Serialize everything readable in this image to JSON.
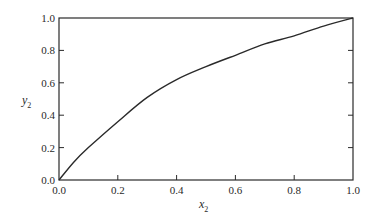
{
  "chart_data": {
    "type": "line",
    "title": "",
    "xlabel": "x2",
    "ylabel": "y2",
    "xlabel_main": "x",
    "xlabel_sub": "2",
    "ylabel_main": "y",
    "ylabel_sub": "2",
    "xlim": [
      0.0,
      1.0
    ],
    "ylim": [
      0.0,
      1.0
    ],
    "grid": false,
    "legend": null,
    "x_ticks": [
      "0.0",
      "0.2",
      "0.4",
      "0.6",
      "0.8",
      "1.0"
    ],
    "y_ticks": [
      "0.0",
      "0.2",
      "0.4",
      "0.6",
      "0.8",
      "1.0"
    ],
    "x": [
      0.0,
      0.05,
      0.1,
      0.2,
      0.3,
      0.4,
      0.5,
      0.6,
      0.7,
      0.8,
      0.9,
      1.0
    ],
    "series": [
      {
        "name": "y2 vs x2",
        "values": [
          0.0,
          0.11,
          0.2,
          0.36,
          0.51,
          0.62,
          0.7,
          0.77,
          0.84,
          0.89,
          0.95,
          1.0
        ]
      }
    ],
    "colors": {
      "line": "#2a2a2a",
      "axes": "#2a2a2a",
      "background": "#ffffff"
    }
  }
}
